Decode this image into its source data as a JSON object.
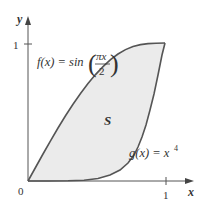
{
  "figure": {
    "axes": {
      "x_label": "x",
      "y_label": "y",
      "origin_label": "0",
      "x_tick_label": "1",
      "y_tick_label": "1"
    },
    "curves": [
      {
        "name": "f",
        "label": "f(x) = sin(πx/2)",
        "label_prefix": "f(x) = sin",
        "frac_num": "πx",
        "frac_den": "2"
      },
      {
        "name": "g",
        "label": "g(x) = x⁴",
        "label_prefix": "g(x) = x",
        "exponent": "4"
      }
    ],
    "region_label": "S",
    "colors": {
      "fill": "#ebebeb",
      "curve": "#555555",
      "axis": "#555555",
      "text": "#333333"
    }
  }
}
